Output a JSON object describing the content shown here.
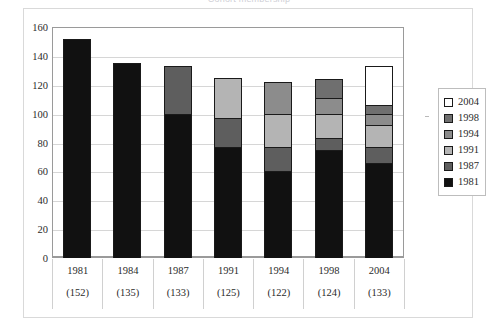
{
  "chart_data": {
    "type": "bar",
    "stacked": true,
    "title": "",
    "xlabel": "",
    "ylabel": "",
    "ylim": [
      0,
      160
    ],
    "yticks": [
      0,
      20,
      40,
      60,
      80,
      100,
      120,
      140,
      160
    ],
    "grid": true,
    "legend_position": "right",
    "categories": [
      "1981",
      "1984",
      "1987",
      "1991",
      "1994",
      "1998",
      "2004"
    ],
    "category_totals": [
      152,
      135,
      133,
      125,
      122,
      124,
      133
    ],
    "category_total_labels": [
      "(152)",
      "(135)",
      "(133)",
      "(125)",
      "(122)",
      "(124)",
      "(133)"
    ],
    "series": [
      {
        "name": "1981",
        "color": "#111111",
        "values": [
          152,
          135,
          100,
          77,
          60,
          75,
          66
        ]
      },
      {
        "name": "1987",
        "color": "#5e5e5e",
        "values": [
          0,
          0,
          33,
          20,
          17,
          8,
          11
        ]
      },
      {
        "name": "1991",
        "color": "#b4b4b4",
        "values": [
          0,
          0,
          0,
          28,
          23,
          17,
          15
        ]
      },
      {
        "name": "1994",
        "color": "#8c8c8c",
        "values": [
          0,
          0,
          0,
          0,
          22,
          11,
          8
        ]
      },
      {
        "name": "1998",
        "color": "#6f6f6f",
        "values": [
          0,
          0,
          0,
          0,
          0,
          13,
          6
        ]
      },
      {
        "name": "2004",
        "color": "#ffffff",
        "values": [
          0,
          0,
          0,
          0,
          0,
          0,
          27
        ]
      }
    ]
  },
  "axis": {
    "y_tick_labels": [
      "160",
      "140",
      "120",
      "100",
      "80",
      "60",
      "40",
      "20",
      "0"
    ]
  },
  "legend": {
    "entries": [
      {
        "label": "2004",
        "color": "#ffffff"
      },
      {
        "label": "1998",
        "color": "#6f6f6f"
      },
      {
        "label": "1994",
        "color": "#8c8c8c"
      },
      {
        "label": "1991",
        "color": "#b4b4b4"
      },
      {
        "label": "1987",
        "color": "#5e5e5e"
      },
      {
        "label": "1981",
        "color": "#111111"
      }
    ]
  },
  "header": {
    "title": "Cohort membership"
  }
}
